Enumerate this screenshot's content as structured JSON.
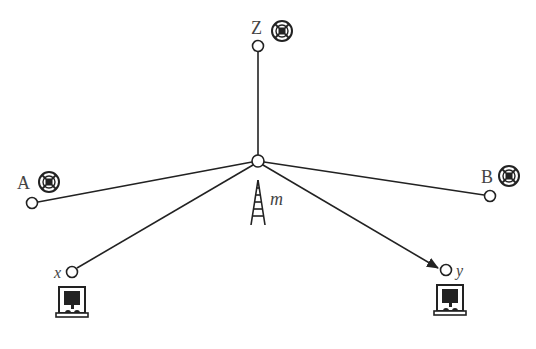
{
  "diagram": {
    "type": "network-topology",
    "center": {
      "label": "m",
      "icon": "radio-tower-icon",
      "x": 258,
      "y": 161
    },
    "nodes": [
      {
        "id": "Z",
        "label": "Z",
        "x": 258,
        "y": 46,
        "icon": "signal-station-icon"
      },
      {
        "id": "A",
        "label": "A",
        "x": 32,
        "y": 203,
        "icon": "signal-station-icon"
      },
      {
        "id": "B",
        "label": "B",
        "x": 490,
        "y": 196,
        "icon": "signal-station-icon"
      },
      {
        "id": "x",
        "label": "x",
        "x": 72,
        "y": 272,
        "icon": "terminal-device-icon"
      },
      {
        "id": "y",
        "label": "y",
        "x": 446,
        "y": 270,
        "icon": "terminal-device-icon"
      }
    ],
    "edges": [
      {
        "from": "m",
        "to": "Z",
        "directed": false
      },
      {
        "from": "m",
        "to": "A",
        "directed": false
      },
      {
        "from": "m",
        "to": "B",
        "directed": false
      },
      {
        "from": "m",
        "to": "x",
        "directed": false
      },
      {
        "from": "m",
        "to": "y",
        "directed": true
      }
    ],
    "colors": {
      "stroke": "#222222",
      "label": "#444444",
      "background": "#ffffff"
    }
  }
}
